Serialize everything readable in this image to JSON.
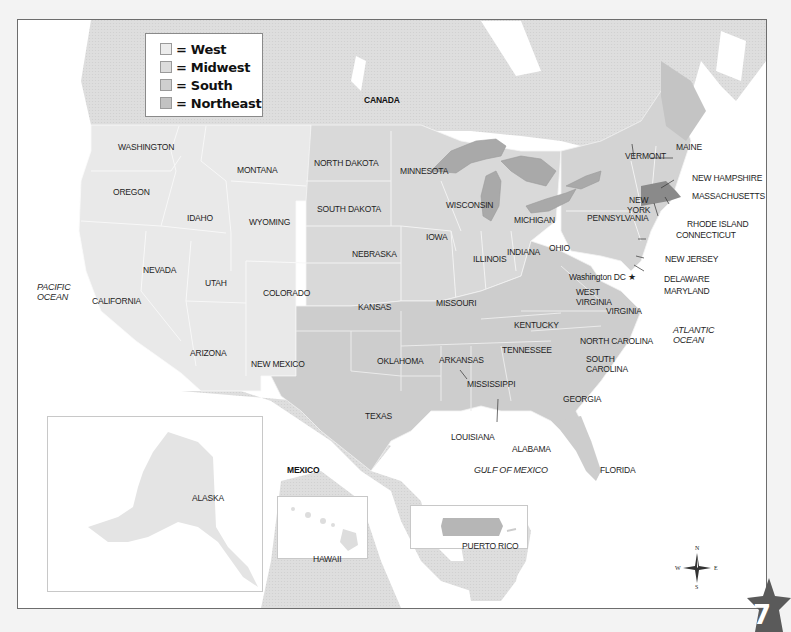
{
  "legend": {
    "items": [
      {
        "label": "= West",
        "color": "#ececec"
      },
      {
        "label": "= Midwest",
        "color": "#dcdcdc"
      },
      {
        "label": "= South",
        "color": "#cfcfcf"
      },
      {
        "label": "= Northeast",
        "color": "#c2c2c2"
      }
    ]
  },
  "colors": {
    "west": "#e9e9e9",
    "midwest": "#d9d9d9",
    "south": "#cdcdcd",
    "northeast": "#d3d3d3",
    "highlight_massachusetts": "#8a8a8a",
    "lakes": "#a9a9a9",
    "foreign_land": "#e0e0e0",
    "water": "#ffffff"
  },
  "countries": {
    "canada": "CANADA",
    "mexico": "MEXICO"
  },
  "oceans": {
    "pacific": [
      "PACIFIC",
      "OCEAN"
    ],
    "atlantic": [
      "ATLANTIC",
      "OCEAN"
    ],
    "gulf": "GULF OF MEXICO"
  },
  "states": {
    "washington": "WASHINGTON",
    "oregon": "OREGON",
    "idaho": "IDAHO",
    "montana": "MONTANA",
    "wyoming": "WYOMING",
    "nevada": "NEVADA",
    "california": "CALIFORNIA",
    "utah": "UTAH",
    "colorado": "COLORADO",
    "arizona": "ARIZONA",
    "new_mexico": "NEW MEXICO",
    "north_dakota": "NORTH DAKOTA",
    "south_dakota": "SOUTH DAKOTA",
    "nebraska": "NEBRASKA",
    "kansas": "KANSAS",
    "minnesota": "MINNESOTA",
    "iowa": "IOWA",
    "missouri": "MISSOURI",
    "wisconsin": "WISCONSIN",
    "illinois": "ILLINOIS",
    "michigan": "MICHIGAN",
    "indiana": "INDIANA",
    "ohio": "OHIO",
    "oklahoma": "OKLAHOMA",
    "texas": "TEXAS",
    "arkansas": "ARKANSAS",
    "louisiana": "LOUISIANA",
    "mississippi": "MISSISSIPPI",
    "alabama": "ALABAMA",
    "tennessee": "TENNESSEE",
    "kentucky": "KENTUCKY",
    "georgia": "GEORGIA",
    "florida": "FLORIDA",
    "south_carolina": [
      "SOUTH",
      "CAROLINA"
    ],
    "north_carolina": "NORTH CAROLINA",
    "virginia": "VIRGINIA",
    "west_virginia": [
      "WEST",
      "VIRGINIA"
    ],
    "maryland": "MARYLAND",
    "delaware": "DELAWARE",
    "new_jersey": "NEW JERSEY",
    "pennsylvania": "PENNSYLVANIA",
    "new_york": [
      "NEW",
      "YORK"
    ],
    "connecticut": "CONNECTICUT",
    "rhode_island": "RHODE ISLAND",
    "massachusetts": "MASSACHUSETTS",
    "vermont": "VERMONT",
    "new_hampshire": "NEW HAMPSHIRE",
    "maine": "MAINE",
    "alaska": "ALASKA",
    "hawaii": "HAWAII",
    "puerto_rico": "PUERTO RICO"
  },
  "capital": {
    "label": "Washington DC",
    "marker": "★"
  },
  "compass": {
    "n": "N",
    "s": "S",
    "e": "E",
    "w": "W"
  },
  "page_badge": {
    "number": "7",
    "color": "#5a5a5a"
  }
}
